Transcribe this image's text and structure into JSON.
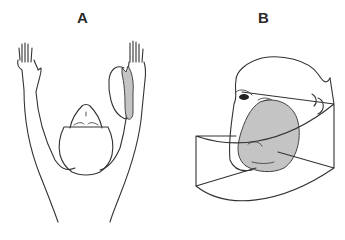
{
  "figure": {
    "panels": [
      {
        "id": "A",
        "label": "A",
        "description": "Top-down view of monkey with both arms raised; shaded recording region near right hand"
      },
      {
        "id": "B",
        "label": "B",
        "description": "Monkey head in three-quarter view with shaded region inside a curved box"
      }
    ],
    "colors": {
      "line": "#333333",
      "shade": "#c4c4c4",
      "background": "#ffffff"
    }
  }
}
